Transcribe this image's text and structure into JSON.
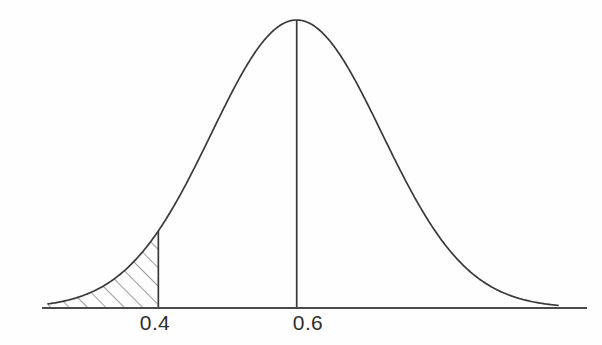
{
  "figure": {
    "kind": "normal-distribution-curve",
    "background_color": "#fefefe",
    "ink_color": "#3a3a3a",
    "label_color": "#2e2e2e",
    "axis_color": "#4a4a4a",
    "hatch_color": "#5a5a5a",
    "title": "",
    "caption": ""
  },
  "axis": {
    "name": "horizontal-axis",
    "y_px": 308,
    "x_start_px": 42,
    "x_end_px": 587,
    "stroke_width": 2
  },
  "ticks": [
    {
      "label": "0.4",
      "value": 0.4,
      "x_px": 160,
      "label_x_px": 155,
      "label_y_px": 312,
      "has_vertical_line": true,
      "vline_top_y_px": 232,
      "vline_bottom_y_px": 308
    },
    {
      "label": "0.6",
      "value": 0.6,
      "x_px": 308,
      "label_x_px": 308,
      "label_y_px": 312,
      "has_vertical_line": true,
      "vline_top_y_px": 20,
      "vline_bottom_y_px": 308
    }
  ],
  "chart_data": {
    "type": "line",
    "title": "",
    "subtitle": "",
    "xlabel": "",
    "ylabel": "",
    "xlim": [
      0.2405,
      0.9777
    ],
    "ylim": [
      0,
      1
    ],
    "grid": false,
    "legend": null,
    "distribution": {
      "family": "normal",
      "mean": 0.6,
      "sigma": 0.1232,
      "peak_x": 0.6,
      "peak_y": 1.0
    },
    "tick_labels": [
      "0.4",
      "0.6"
    ],
    "tick_values": [
      0.4,
      0.6
    ],
    "annotations": [
      {
        "name": "shaded-left-tail",
        "type": "shaded-region",
        "hatched": true,
        "hatch_angle_deg": 45,
        "x_from": 0.2486,
        "x_to": 0.4,
        "description": "Hatched left tail area under the curve up to 0.4"
      },
      {
        "name": "mean-line",
        "type": "vertical-line",
        "x": 0.6,
        "description": "Vertical line at the mean 0.6 from axis to curve peak"
      },
      {
        "name": "boundary-line",
        "type": "vertical-line",
        "x": 0.4,
        "description": "Vertical line at 0.4 from axis to the curve"
      }
    ],
    "x": [
      0.2405,
      0.2486,
      0.2756,
      0.3027,
      0.3297,
      0.3568,
      0.3838,
      0.4,
      0.4108,
      0.4378,
      0.4649,
      0.4919,
      0.5189,
      0.546,
      0.573,
      0.6,
      0.627,
      0.6541,
      0.6811,
      0.7081,
      0.7352,
      0.7622,
      0.7892,
      0.8163,
      0.8433,
      0.8704,
      0.8974,
      0.9244,
      0.9515,
      0.9777
    ],
    "y": [
      0.0053,
      0.009,
      0.0268,
      0.0664,
      0.1422,
      0.2655,
      0.4348,
      0.2644,
      0.6236,
      0.7939,
      0.9265,
      0.9939,
      0.9939,
      0.9265,
      0.7939,
      1.0,
      0.7939,
      0.6236,
      0.4348,
      0.2655,
      0.1422,
      0.0664,
      0.0268,
      0.009,
      0.0026,
      0.0006,
      0.0001,
      0.0,
      0.0,
      0.0
    ]
  },
  "curve_path_px": {
    "left_tail_x": 48,
    "left_tail_y": 282,
    "right_tail_x": 558,
    "right_tail_y": 285,
    "peak_x": 308,
    "peak_y": 20,
    "baseline_y": 308
  },
  "hatching": {
    "name": "left-tail-hatch",
    "line_count": 9,
    "angle_deg": 45,
    "spacing_px": 13,
    "stroke_width": 1.2,
    "region_x_start": 48,
    "region_x_end": 160
  }
}
